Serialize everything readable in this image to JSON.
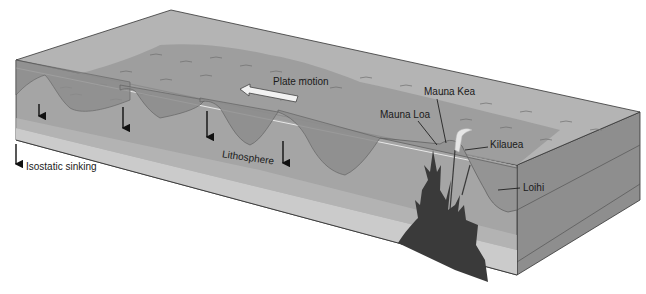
{
  "diagram": {
    "labels": {
      "plate_motion": "Plate motion",
      "mauna_kea": "Mauna Kea",
      "mauna_loa": "Mauna Loa",
      "kilauea": "Kilauea",
      "loihi": "Loihi",
      "lithosphere": "Lithosphere",
      "isostatic_sinking": "Isostatic sinking"
    },
    "colors": {
      "background": "#ffffff",
      "top_face": "#a9a9a9",
      "ocean_surface": "#b8b8b8",
      "seafloor": "#8f8f8f",
      "front_face": "#a3a3a3",
      "lithosphere_lower": "#c8c8c8",
      "right_face": "#8a8a8a",
      "magma": "#3c3c3c",
      "arrow": "#111111",
      "plate_arrow_fill": "#f2f2f2"
    },
    "legend": {
      "arrow_meaning": "Isostatic sinking"
    }
  }
}
